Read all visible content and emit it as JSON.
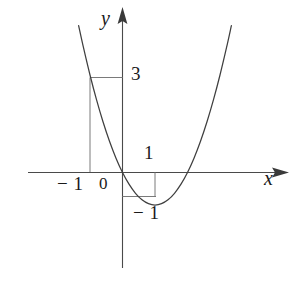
{
  "figure": {
    "title": ""
  },
  "axes": {
    "x_axis_label": "x",
    "y_axis_label": "y",
    "origin_label": "0"
  },
  "annotations": {
    "y_value_3": "3",
    "x_value_1": "1",
    "x_value_minus1": "− 1",
    "y_value_minus1": "− 1"
  },
  "style": {
    "curve_color": "#3f3f3f",
    "axis_color": "#4a4a4a",
    "guide_color": "#6b6b6b",
    "text_color": "#1a1a1a",
    "background": "#ffffff"
  },
  "chart_data": {
    "type": "line",
    "title": "",
    "xlabel": "x",
    "ylabel": "y",
    "equation": "y = x^2 - 2x",
    "xlim": [
      -1.35,
      3.35
    ],
    "ylim": [
      -1.6,
      5.1
    ],
    "grid": false,
    "legend": null,
    "series": [
      {
        "name": "y = x^2 - 2x",
        "x": [
          -1.35,
          -1.2,
          -1.0,
          -0.8,
          -0.6,
          -0.4,
          -0.2,
          0.0,
          0.2,
          0.4,
          0.6,
          0.8,
          1.0,
          1.2,
          1.4,
          1.6,
          1.8,
          2.0,
          2.2,
          2.4,
          2.6,
          2.8,
          3.0,
          3.2,
          3.35
        ],
        "y": [
          4.52,
          3.84,
          3.0,
          2.24,
          1.56,
          0.96,
          0.44,
          0.0,
          -0.36,
          -0.64,
          -0.84,
          -0.96,
          -1.0,
          -0.96,
          -0.84,
          -0.64,
          -0.36,
          0.0,
          0.44,
          0.96,
          1.56,
          2.24,
          3.0,
          3.84,
          4.52
        ]
      }
    ],
    "key_points": [
      {
        "label": "vertex",
        "x": 1,
        "y": -1
      },
      {
        "label": "root",
        "x": 0,
        "y": 0
      },
      {
        "label": "root",
        "x": 2,
        "y": 0
      },
      {
        "label": "point",
        "x": -1,
        "y": 3
      }
    ],
    "xticks": [
      -1,
      0,
      1
    ],
    "xticklabels": [
      "− 1",
      "0",
      "1"
    ],
    "yticks": [
      -1,
      3
    ],
    "yticklabels": [
      "− 1",
      "3"
    ],
    "guide_lines": [
      {
        "name": "vertical-at-x-minus1",
        "from": [
          -1,
          0
        ],
        "to": [
          -1,
          3
        ]
      },
      {
        "name": "horizontal-at-y-3",
        "from": [
          -1,
          3
        ],
        "to": [
          0,
          3
        ]
      },
      {
        "name": "vertical-at-x-1",
        "from": [
          1,
          0
        ],
        "to": [
          1,
          -1
        ]
      },
      {
        "name": "horizontal-at-y-minus1",
        "from": [
          0,
          -1
        ],
        "to": [
          1,
          -1
        ]
      }
    ]
  }
}
